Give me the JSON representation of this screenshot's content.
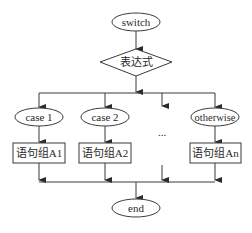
{
  "diagram": {
    "type": "flowchart",
    "start": {
      "label": "switch",
      "shape": "ellipse"
    },
    "condition": {
      "label": "表达式",
      "shape": "diamond"
    },
    "cases": [
      {
        "label": "case 1",
        "shape": "ellipse",
        "block": "语句组A1"
      },
      {
        "label": "case 2",
        "shape": "ellipse",
        "block": "语句组A2"
      },
      {
        "label": "otherwise",
        "shape": "ellipse",
        "block": "语句组An"
      }
    ],
    "ellipsis": "...",
    "end": {
      "label": "end",
      "shape": "ellipse"
    },
    "colors": {
      "line": "#3a3a3a",
      "fill": "#ffffff",
      "text": "#2a2a2a"
    }
  }
}
